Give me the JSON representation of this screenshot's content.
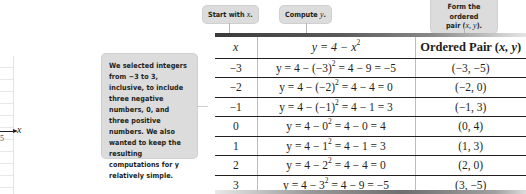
{
  "graph_fragment": {
    "axis_label": "x",
    "tick_label": "5"
  },
  "callouts": {
    "note": "We selected integers from −3 to 3, inclusive, to include three negative numbers, 0, and three positive numbers. We also wanted to keep the resulting computations for y relatively simple.",
    "start_prefix": "Start with ",
    "start_var": "x",
    "compute_prefix": "Compute ",
    "compute_var": "y",
    "form_line1": "Form the ordered",
    "form_line2_prefix": "pair (",
    "form_line2_vars": "x, y",
    "form_line2_suffix": ")."
  },
  "table": {
    "headers": {
      "x": "x",
      "equation": "y = 4 − x",
      "equation_exp": "2",
      "ordered_pair_prefix": "Ordered Pair (",
      "ordered_pair_vars": "x, y",
      "ordered_pair_suffix": ")"
    },
    "rows": [
      {
        "x": "−3",
        "comp_pre": "y = 4 − (−3)",
        "exp": "2",
        "comp_post": " = 4 − 9 = −5",
        "pair": "(−3, −5)"
      },
      {
        "x": "−2",
        "comp_pre": "y = 4 − (−2)",
        "exp": "2",
        "comp_post": " = 4 − 4 = 0",
        "pair": "(−2, 0)"
      },
      {
        "x": "−1",
        "comp_pre": "y = 4 − (−1)",
        "exp": "2",
        "comp_post": " = 4 − 1 = 3",
        "pair": "(−1, 3)"
      },
      {
        "x": "0",
        "comp_pre": "y = 4 − 0",
        "exp": "2",
        "comp_post": " = 4 − 0 = 4",
        "pair": "(0, 4)"
      },
      {
        "x": "1",
        "comp_pre": "y = 4 − 1",
        "exp": "2",
        "comp_post": " = 4 − 1 = 3",
        "pair": "(1, 3)"
      },
      {
        "x": "2",
        "comp_pre": "y = 4 − 2",
        "exp": "2",
        "comp_post": " = 4 − 4 = 0",
        "pair": "(2, 0)"
      },
      {
        "x": "3",
        "comp_pre": "y = 4 − 3",
        "exp": "2",
        "comp_post": " = 4 − 9 = −5",
        "pair": "(3, −5)"
      }
    ]
  }
}
